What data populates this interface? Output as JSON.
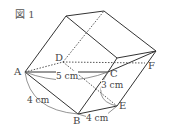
{
  "figure": {
    "caption": "図 1",
    "vertices": {
      "A": "A",
      "B": "B",
      "C": "C",
      "D": "D",
      "E": "E",
      "F": "F"
    },
    "measurements": {
      "AC": "5 cm",
      "AB": "4 cm",
      "BE": "4 cm",
      "CE": "3 cm"
    },
    "colors": {
      "line": "#333333",
      "text": "#444444",
      "background": "#ffffff"
    }
  }
}
